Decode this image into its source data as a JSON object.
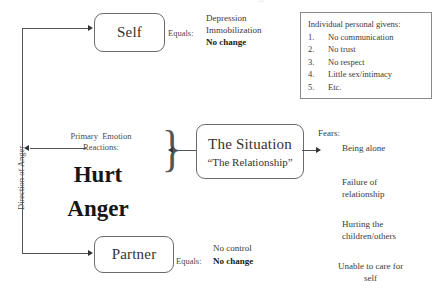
{
  "nodes": {
    "self": {
      "label": "Self"
    },
    "partner": {
      "label": "Partner"
    },
    "situation": {
      "label": "The Situation",
      "sublabel": "“The Relationship”"
    }
  },
  "axis": {
    "direction_label": "Direction of Anger"
  },
  "center": {
    "reactions_line1": "Primary  Emotion",
    "reactions_line2": "Reactions:",
    "emotion1": "Hurt",
    "emotion2": "Anger"
  },
  "self_outcome": {
    "connector": "Equals:",
    "line1": "Depression",
    "line2": "Immobilization",
    "line3_bold": "No change"
  },
  "partner_outcome": {
    "connector": "Equals:",
    "line1": "No control",
    "line2_bold": "No change"
  },
  "givens": {
    "title": "Individual personal givens:",
    "items": [
      {
        "num": "1.",
        "text": "No communication"
      },
      {
        "num": "2.",
        "text": "No trust"
      },
      {
        "num": "3.",
        "text": "No respect"
      },
      {
        "num": "4.",
        "text": "Little sex/intimacy"
      },
      {
        "num": "5.",
        "text": "Etc."
      }
    ]
  },
  "fears": {
    "title": "Fears:",
    "items": [
      {
        "line1": "Being alone",
        "line2": ""
      },
      {
        "line1": "Failure of",
        "line2": "relationship"
      },
      {
        "line1": "Hurting the",
        "line2": "children/others"
      },
      {
        "line1": "Unable to care for",
        "line2": "self"
      }
    ]
  },
  "colors": {
    "ink": "#2b2b2b",
    "line": "#555555",
    "box_border": "#6b6b6b",
    "rect_border": "#8a8a8a"
  }
}
